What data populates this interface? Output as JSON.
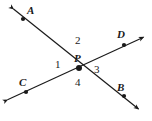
{
  "figure": {
    "type": "geometry-diagram",
    "background_color": "#ffffff",
    "stroke_color": "#1a1a1a",
    "width": 152,
    "height": 121
  },
  "points": {
    "A": {
      "label": "A",
      "x": 23,
      "y": 19,
      "label_x": 27,
      "label_y": 5
    },
    "B": {
      "label": "B",
      "x": 124,
      "y": 96,
      "label_x": 117,
      "label_y": 82
    },
    "C": {
      "label": "C",
      "x": 26,
      "y": 92,
      "label_x": 19,
      "label_y": 77
    },
    "D": {
      "label": "D",
      "x": 124,
      "y": 45,
      "label_x": 117,
      "label_y": 29
    },
    "P": {
      "label": "P",
      "x": 79,
      "y": 68,
      "label_x": 74,
      "label_y": 53
    }
  },
  "lines": [
    {
      "name": "line-AB",
      "from_arrow": {
        "x": 11,
        "y": 7
      },
      "to_arrow": {
        "x": 141,
        "y": 111
      },
      "through": [
        "A",
        "P",
        "B"
      ]
    },
    {
      "name": "line-CD",
      "from_arrow": {
        "x": 5,
        "y": 101
      },
      "to_arrow": {
        "x": 146,
        "y": 36
      },
      "through": [
        "C",
        "P",
        "D"
      ]
    }
  ],
  "angles": [
    {
      "id": "angle-1",
      "label": "1",
      "x": 55,
      "y": 59,
      "position": "left-of-P"
    },
    {
      "id": "angle-2",
      "label": "2",
      "x": 75,
      "y": 35,
      "position": "above-P"
    },
    {
      "id": "angle-3",
      "label": "3",
      "x": 94,
      "y": 64,
      "position": "right-of-P"
    },
    {
      "id": "angle-4",
      "label": "4",
      "x": 75,
      "y": 77,
      "position": "below-P"
    }
  ]
}
